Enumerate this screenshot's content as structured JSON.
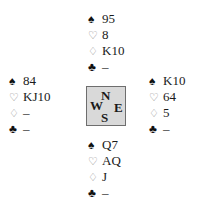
{
  "hands": {
    "north": {
      "spades": "95",
      "hearts": "8",
      "diamonds": "K10",
      "clubs": "–"
    },
    "west": {
      "spades": "84",
      "hearts": "KJ10",
      "diamonds": "–",
      "clubs": "–"
    },
    "east": {
      "spades": "K10",
      "hearts": "64",
      "diamonds": "5",
      "clubs": "–"
    },
    "south": {
      "spades": "Q7",
      "hearts": "AQ",
      "diamonds": "J",
      "clubs": "–"
    }
  },
  "suit_icons": {
    "spades": "♠",
    "hearts": "♡",
    "diamonds": "♢",
    "clubs": "♣"
  },
  "compass": {
    "north": "N",
    "west": "W",
    "east": "E",
    "south": "S"
  },
  "colors": {
    "compass_bg": "#d9d9d9",
    "compass_border": "#6e6e6e",
    "red_suit": "#8a8a8a"
  }
}
